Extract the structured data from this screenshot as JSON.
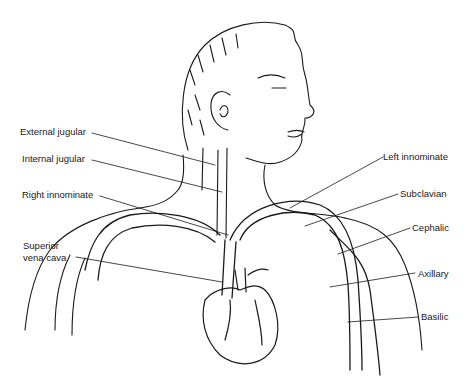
{
  "figure": {
    "labels_left": [
      {
        "id": "external-jugular",
        "text": "External jugular"
      },
      {
        "id": "internal-jugular",
        "text": "Internal jugular"
      },
      {
        "id": "right-innominate",
        "text": "Right innominate"
      },
      {
        "id": "superior-vena-cava-1",
        "text": "Superior"
      },
      {
        "id": "superior-vena-cava-2",
        "text": "vena cava"
      }
    ],
    "labels_right": [
      {
        "id": "left-innominate",
        "text": "Left innominate"
      },
      {
        "id": "subclavian",
        "text": "Subclavian"
      },
      {
        "id": "cephalic",
        "text": "Cephalic"
      },
      {
        "id": "axillary",
        "text": "Axillary"
      },
      {
        "id": "basilic",
        "text": "Basilic"
      }
    ]
  }
}
